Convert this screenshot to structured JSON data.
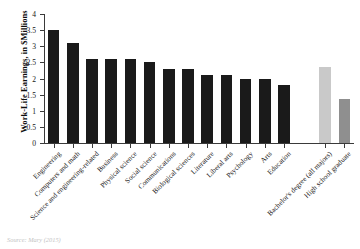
{
  "chart_data": {
    "type": "bar",
    "title": "",
    "subtitle": "",
    "xlabel": "",
    "ylabel": "Work-Life Earnings, in $Millions",
    "ylim": [
      0,
      4
    ],
    "ytick_labels": [
      "0",
      "0.5",
      "1",
      "1.5",
      "2",
      "2.5",
      "3",
      "3.5",
      "4"
    ],
    "ytick_values": [
      0,
      0.5,
      1,
      1.5,
      2,
      2.5,
      3,
      3.5,
      4
    ],
    "grid": false,
    "legend": "none",
    "categories": [
      "Engineering",
      "Computers and math",
      "Science and engineering-related",
      "Business",
      "Physical science",
      "Social science",
      "Communications",
      "Biological sciences",
      "Literature",
      "Liberal arts",
      "Psychology",
      "Arts",
      "Education",
      "Bachelor's degree (all majors)",
      "High school graduate"
    ],
    "values": [
      3.5,
      3.1,
      2.6,
      2.6,
      2.6,
      2.5,
      2.3,
      2.3,
      2.1,
      2.1,
      2.0,
      2.0,
      1.8,
      2.35,
      1.35
    ],
    "bar_colors": [
      "#1a1a1a",
      "#1a1a1a",
      "#1a1a1a",
      "#1a1a1a",
      "#1a1a1a",
      "#1a1a1a",
      "#1a1a1a",
      "#1a1a1a",
      "#1a1a1a",
      "#1a1a1a",
      "#1a1a1a",
      "#1a1a1a",
      "#1a1a1a",
      "#c9c9c9",
      "#8f8f8f"
    ],
    "gap_before_index": 13
  },
  "caption": "Source: Mary (2015)",
  "colors": {
    "major_bar": "#1a1a1a",
    "benchmark_bar_light": "#c9c9c9",
    "benchmark_bar_dark": "#8f8f8f",
    "axis": "#3a3a3a",
    "background": "#ffffff"
  }
}
